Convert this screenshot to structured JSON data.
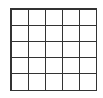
{
  "board": {
    "rows": 5,
    "cols": 5,
    "cells": [
      [
        "",
        "",
        "",
        "",
        ""
      ],
      [
        "",
        "",
        "",
        "",
        ""
      ],
      [
        "",
        "",
        "",
        "",
        ""
      ],
      [
        "",
        "",
        "",
        "",
        ""
      ],
      [
        "",
        "",
        "",
        "",
        ""
      ]
    ],
    "line_color": "#333333",
    "background": "#ffffff"
  }
}
